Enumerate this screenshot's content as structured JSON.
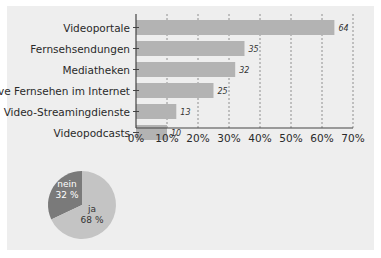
{
  "chart_data": [
    {
      "type": "bar",
      "orientation": "horizontal",
      "title": "",
      "xlabel": "",
      "ylabel": "",
      "categories": [
        "Videoportale",
        "Fernsehsendungen",
        "Mediatheken",
        "live Fernsehen im Internet",
        "Video-Streamingdienste",
        "Videopodcasts"
      ],
      "values": [
        64,
        35,
        32,
        25,
        13,
        10
      ],
      "value_labels": [
        "64",
        "35",
        "32",
        "25",
        "13",
        "10"
      ],
      "xlim": [
        0,
        70
      ],
      "x_ticks": [
        0,
        10,
        20,
        30,
        40,
        50,
        60,
        70
      ],
      "x_tick_labels": [
        "0%",
        "10%",
        "20%",
        "30%",
        "40%",
        "50%",
        "60%",
        "70%"
      ],
      "grid": "vertical dashed",
      "bar_color": "#b3b3b3"
    },
    {
      "type": "pie",
      "slices": [
        {
          "label": "nein",
          "value": 32,
          "value_label": "32 %",
          "color": "#7a7a7a",
          "text_color": "#ffffff"
        },
        {
          "label": "ja",
          "value": 68,
          "value_label": "68 %",
          "color": "#c4c4c4",
          "text_color": "#333333"
        }
      ]
    }
  ],
  "colors": {
    "panel_background": "#eeeeee",
    "axis": "#444444",
    "grid": "#777777"
  }
}
